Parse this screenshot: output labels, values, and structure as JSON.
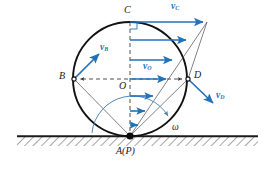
{
  "figure": {
    "colors": {
      "vector": "#2272b8",
      "outline": "#111111",
      "thin_line": "#55555a",
      "dashed": "#333333",
      "ground": "#222222",
      "arc": "#5b8fc0"
    },
    "geometry": {
      "center": {
        "x": 130,
        "y": 79
      },
      "radius": 57,
      "contact_point": {
        "x": 130,
        "y": 136
      },
      "top_point": {
        "x": 130,
        "y": 22
      },
      "left_point": {
        "x": 74,
        "y": 79
      },
      "right_point": {
        "x": 188,
        "y": 79
      },
      "ground_y": 136,
      "ground_x1": 17,
      "ground_x2": 258
    }
  },
  "labels": {
    "point_C": {
      "text": "C",
      "x": 124,
      "y": 6
    },
    "point_B": {
      "text": "B",
      "x": 60,
      "y": 72
    },
    "point_O": {
      "text": "O",
      "x": 120,
      "y": 82
    },
    "point_D": {
      "text": "D",
      "x": 194,
      "y": 71
    },
    "point_A": {
      "main": "A",
      "paren": "(P)",
      "x": 116,
      "y": 147
    },
    "omega": {
      "text": "ω",
      "x": 173,
      "y": 124
    }
  },
  "vectors": {
    "v_C": {
      "base": "v",
      "sub": "C",
      "x": 172,
      "y": 3,
      "from": {
        "x": 130,
        "y": 22
      },
      "to": {
        "x": 207,
        "y": 22
      }
    },
    "v_B": {
      "base": "v",
      "sub": "B",
      "x": 101,
      "y": 44,
      "from": {
        "x": 74,
        "y": 79
      },
      "to": {
        "x": 101,
        "y": 52
      }
    },
    "v_O": {
      "base": "v",
      "sub": "O",
      "x": 144,
      "y": 63,
      "from": {
        "x": 130,
        "y": 79
      },
      "to": {
        "x": 169,
        "y": 79
      }
    },
    "v_D": {
      "base": "v",
      "sub": "D",
      "x": 218,
      "y": 93,
      "from": {
        "x": 188,
        "y": 79
      },
      "to": {
        "x": 216,
        "y": 106
      }
    }
  },
  "profile_arrows": [
    {
      "y": 22,
      "x_end": 206
    },
    {
      "y": 40,
      "x_end": 189
    },
    {
      "y": 60,
      "x_end": 175
    },
    {
      "y": 79,
      "x_end": 169
    },
    {
      "y": 96,
      "x_end": 156
    },
    {
      "y": 111,
      "x_end": 147
    },
    {
      "y": 125,
      "x_end": 140
    }
  ]
}
